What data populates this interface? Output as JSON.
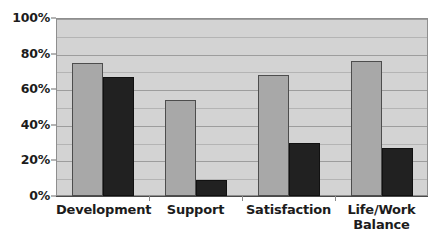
{
  "chart_data": {
    "type": "bar",
    "title": "",
    "subtitle": "",
    "xlabel": "",
    "ylabel": "",
    "categories": [
      "Development",
      "Support",
      "Satisfaction",
      "Life/Work Balance"
    ],
    "category_lines": [
      [
        "Development"
      ],
      [
        "Support"
      ],
      [
        "Satisfaction"
      ],
      [
        "Life/Work",
        "Balance"
      ]
    ],
    "series": [
      {
        "name": "series-a",
        "values": [
          75,
          54,
          68,
          76
        ]
      },
      {
        "name": "series-b",
        "values": [
          67,
          9,
          30,
          27
        ]
      }
    ],
    "ylim": [
      0,
      100
    ],
    "y_ticks": [
      0,
      20,
      40,
      60,
      80,
      100
    ],
    "y_tick_labels": [
      "0%",
      "20%",
      "40%",
      "60%",
      "80%",
      "100%"
    ],
    "y_minor_ticks": [
      10,
      30,
      50,
      70,
      90
    ],
    "grid": true,
    "legend": "none",
    "value_suffix": "%",
    "colors": {
      "series_a": "#a8a8a8",
      "series_a_border": "#4d4d4d",
      "series_b": "#212121",
      "series_b_border": "#111111",
      "plot_background": "#d3d3d3",
      "gridline": "#9d9d9d",
      "gridline_minor": "#b4b4b4",
      "axis": "#4a4a4a",
      "text": "#1c1c1c",
      "page_background": "#ffffff"
    }
  }
}
